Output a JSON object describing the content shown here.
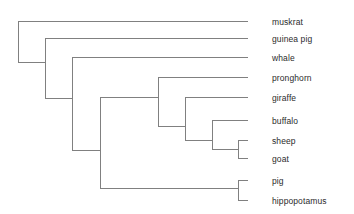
{
  "figure": {
    "type": "cladogram",
    "title": "",
    "orientation": "left-to-right",
    "background_color": "#ffffff",
    "line_color": "#808080",
    "text_color": "#2b2b2b",
    "line_width": 1
  },
  "taxa": [
    {
      "id": "muskrat",
      "label": "muskrat",
      "y": 21,
      "tip_x": 248,
      "label_x": 272
    },
    {
      "id": "guinea-pig",
      "label": "guinea pig",
      "y": 38,
      "tip_x": 248,
      "label_x": 272
    },
    {
      "id": "whale",
      "label": "whale",
      "y": 57,
      "tip_x": 248,
      "label_x": 272
    },
    {
      "id": "pronghorn",
      "label": "pronghorn",
      "y": 77,
      "tip_x": 248,
      "label_x": 272
    },
    {
      "id": "giraffe",
      "label": "giraffe",
      "y": 97,
      "tip_x": 248,
      "label_x": 272
    },
    {
      "id": "buffalo",
      "label": "buffalo",
      "y": 120,
      "tip_x": 248,
      "label_x": 272
    },
    {
      "id": "sheep",
      "label": "sheep",
      "y": 140,
      "tip_x": 248,
      "label_x": 272
    },
    {
      "id": "goat",
      "label": "goat",
      "y": 158,
      "tip_x": 248,
      "label_x": 272
    },
    {
      "id": "pig",
      "label": "pig",
      "y": 180,
      "tip_x": 248,
      "label_x": 272
    },
    {
      "id": "hippopotamus",
      "label": "hippopotamus",
      "y": 200,
      "tip_x": 248,
      "label_x": 272
    }
  ],
  "nodes": [
    {
      "id": "node-root",
      "name": "root-node",
      "x": 18,
      "y_top": 21,
      "y_bottom": 62,
      "parent_x": 18,
      "parent_y": 62
    },
    {
      "id": "node-rodent-split",
      "name": "guinea-pig-split-node",
      "x": 45,
      "y_top": 38,
      "y_bottom": 98,
      "parent_x": 18,
      "parent_y": 98
    },
    {
      "id": "node-whale-split",
      "name": "whale-split-node",
      "x": 72,
      "y_top": 57,
      "y_bottom": 150,
      "parent_x": 45,
      "parent_y": 150
    },
    {
      "id": "node-artiodactyl",
      "name": "artiodactyl-node",
      "x": 100,
      "y_top": 97,
      "y_bottom": 188,
      "parent_x": 72,
      "parent_y": 188
    },
    {
      "id": "node-pronghorn",
      "name": "pronghorn-split-node",
      "x": 158,
      "y_top": 77,
      "y_bottom": 126,
      "parent_x": 100,
      "parent_y": 126
    },
    {
      "id": "node-giraffe",
      "name": "giraffe-split-node",
      "x": 185,
      "y_top": 97,
      "y_bottom": 140,
      "parent_x": 158,
      "parent_y": 140
    },
    {
      "id": "node-buffalo",
      "name": "buffalo-split-node",
      "x": 212,
      "y_top": 120,
      "y_bottom": 149,
      "parent_x": 185,
      "parent_y": 149
    },
    {
      "id": "node-sheep-goat",
      "name": "sheep-goat-node",
      "x": 238,
      "y_top": 140,
      "y_bottom": 158,
      "parent_x": 212,
      "parent_y": 158
    },
    {
      "id": "node-pig-hippo",
      "name": "pig-hippopotamus-node",
      "x": 238,
      "y_top": 180,
      "y_bottom": 200,
      "parent_x": 100,
      "parent_y": 200
    }
  ],
  "branches": [
    {
      "id": "branch-muskrat",
      "name": "branch-muskrat",
      "x1": 18,
      "x2": 248,
      "y": 21
    },
    {
      "id": "branch-guinea-pig",
      "name": "branch-guinea-pig",
      "x1": 45,
      "x2": 248,
      "y": 38
    },
    {
      "id": "branch-whale",
      "name": "branch-whale",
      "x1": 72,
      "x2": 248,
      "y": 57
    },
    {
      "id": "branch-pronghorn",
      "name": "branch-pronghorn",
      "x1": 158,
      "x2": 248,
      "y": 77
    },
    {
      "id": "branch-giraffe",
      "name": "branch-giraffe",
      "x1": 185,
      "x2": 248,
      "y": 97
    },
    {
      "id": "branch-buffalo",
      "name": "branch-buffalo",
      "x1": 212,
      "x2": 248,
      "y": 120
    },
    {
      "id": "branch-sheep",
      "name": "branch-sheep",
      "x1": 238,
      "x2": 248,
      "y": 140
    },
    {
      "id": "branch-goat",
      "name": "branch-goat",
      "x1": 238,
      "x2": 248,
      "y": 158
    },
    {
      "id": "branch-pig",
      "name": "branch-pig",
      "x1": 238,
      "x2": 248,
      "y": 180
    },
    {
      "id": "branch-hippopotamus",
      "name": "branch-hippopotamus",
      "x1": 238,
      "x2": 248,
      "y": 200
    },
    {
      "id": "stem-rodent-split",
      "name": "stem-guinea-pig-node",
      "x1": 18,
      "x2": 45,
      "y": 62
    },
    {
      "id": "stem-whale-split",
      "name": "stem-whale-node",
      "x1": 45,
      "x2": 72,
      "y": 98
    },
    {
      "id": "stem-artiodactyl",
      "name": "stem-artiodactyl-node",
      "x1": 72,
      "x2": 100,
      "y": 150
    },
    {
      "id": "stem-pronghorn",
      "name": "stem-pronghorn-node",
      "x1": 100,
      "x2": 158,
      "y": 97
    },
    {
      "id": "stem-giraffe",
      "name": "stem-giraffe-node",
      "x1": 158,
      "x2": 185,
      "y": 126
    },
    {
      "id": "stem-buffalo",
      "name": "stem-buffalo-node",
      "x1": 185,
      "x2": 212,
      "y": 140
    },
    {
      "id": "stem-sheep-goat",
      "name": "stem-sheep-goat-node",
      "x1": 212,
      "x2": 238,
      "y": 149
    },
    {
      "id": "stem-pig-hippo",
      "name": "stem-pig-hippo-node",
      "x1": 100,
      "x2": 238,
      "y": 188
    }
  ],
  "verticals": [
    {
      "id": "v-root",
      "name": "vertical-root-node",
      "x": 18,
      "y1": 21,
      "y2": 62
    },
    {
      "id": "v-rodent",
      "name": "vertical-guinea-pig-node",
      "x": 45,
      "y1": 38,
      "y2": 98
    },
    {
      "id": "v-whale",
      "name": "vertical-whale-node",
      "x": 72,
      "y1": 57,
      "y2": 150
    },
    {
      "id": "v-artiodactyl",
      "name": "vertical-artiodactyl-node",
      "x": 100,
      "y1": 97,
      "y2": 188
    },
    {
      "id": "v-pronghorn",
      "name": "vertical-pronghorn-node",
      "x": 158,
      "y1": 77,
      "y2": 126
    },
    {
      "id": "v-giraffe",
      "name": "vertical-giraffe-node",
      "x": 185,
      "y1": 97,
      "y2": 140
    },
    {
      "id": "v-buffalo",
      "name": "vertical-buffalo-node",
      "x": 212,
      "y1": 120,
      "y2": 149
    },
    {
      "id": "v-sheep-goat",
      "name": "vertical-sheep-goat-node",
      "x": 238,
      "y1": 140,
      "y2": 158
    },
    {
      "id": "v-pig-hippo",
      "name": "vertical-pig-hippo-node",
      "x": 238,
      "y1": 180,
      "y2": 200
    }
  ]
}
